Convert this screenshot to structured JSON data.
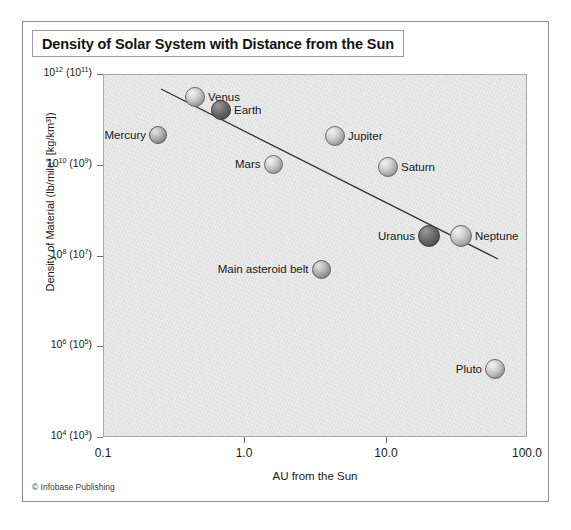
{
  "figure": {
    "title": "Density of Solar System with Distance from the Sun",
    "credit": "© Infobase Publishing"
  },
  "chart_data": {
    "type": "scatter",
    "title": "Density of Solar System with Distance from the Sun",
    "xlabel": "AU from the Sun",
    "ylabel": "Density of Material (lb/mile³ [kg/km³])",
    "xscale": "log",
    "yscale": "log",
    "xlim": [
      0.1,
      100.0
    ],
    "ylim": [
      10000.0,
      1000000000000.0
    ],
    "grid": false,
    "legend": "none",
    "xticks": [
      {
        "value": 0.1,
        "label": "0.1"
      },
      {
        "value": 1.0,
        "label": "1.0"
      },
      {
        "value": 10.0,
        "label": "10.0"
      },
      {
        "value": 100.0,
        "label": "100.0"
      }
    ],
    "yticks": [
      {
        "value": 1000000000000.0,
        "label": "10",
        "exp": "12",
        "alt_label": "(10",
        "alt_exp": "11",
        "alt_close": ")"
      },
      {
        "value": 10000000000.0,
        "label": "10",
        "exp": "10",
        "alt_label": "(10",
        "alt_exp": "9",
        "alt_close": ")"
      },
      {
        "value": 100000000.0,
        "label": "10",
        "exp": "8",
        "alt_label": "(10",
        "alt_exp": "7",
        "alt_close": ")"
      },
      {
        "value": 1000000.0,
        "label": "10",
        "exp": "6",
        "alt_label": "(10",
        "alt_exp": "5",
        "alt_close": ")"
      },
      {
        "value": 10000.0,
        "label": "10",
        "exp": "4",
        "alt_label": "(10",
        "alt_exp": "3",
        "alt_close": ")"
      }
    ],
    "points": [
      {
        "name": "Mercury",
        "x": 0.24,
        "y": 40000000000.0,
        "px": 157,
        "py": 134,
        "r": 9,
        "shade": "mid",
        "label_side": "left"
      },
      {
        "name": "Venus",
        "x": 0.5,
        "y": 300000000000.0,
        "px": 194,
        "py": 96,
        "r": 10,
        "shade": "light",
        "label_side": "right"
      },
      {
        "name": "Earth",
        "x": 0.8,
        "y": 150000000000.0,
        "px": 220,
        "py": 109,
        "r": 10,
        "shade": "dark",
        "label_side": "right"
      },
      {
        "name": "Mars",
        "x": 1.8,
        "y": 10000000000.0,
        "px": 272,
        "py": 163,
        "r": 9.5,
        "shade": "light",
        "label_side": "left"
      },
      {
        "name": "Main asteroid belt",
        "x": 4.0,
        "y": 50000000.0,
        "px": 320,
        "py": 268,
        "r": 9.5,
        "shade": "mid",
        "label_side": "left"
      },
      {
        "name": "Jupiter",
        "x": 5.2,
        "y": 45000000000.0,
        "px": 334,
        "py": 135,
        "r": 10,
        "shade": "light",
        "label_side": "right"
      },
      {
        "name": "Saturn",
        "x": 11.0,
        "y": 9000000000.0,
        "px": 387,
        "py": 166,
        "r": 10,
        "shade": "light",
        "label_side": "right"
      },
      {
        "name": "Uranus",
        "x": 22.0,
        "y": 25000000.0,
        "px": 428,
        "py": 235,
        "r": 11,
        "shade": "dark",
        "label_side": "left"
      },
      {
        "name": "Neptune",
        "x": 35.0,
        "y": 25000000.0,
        "px": 460,
        "py": 235,
        "r": 11,
        "shade": "light",
        "label_side": "right"
      },
      {
        "name": "Pluto",
        "x": 55.0,
        "y": 300000.0,
        "px": 494,
        "py": 368,
        "r": 10,
        "shade": "light",
        "label_side": "left"
      }
    ],
    "trend_line": {
      "label": "fit line",
      "x1_px": 160,
      "y1_px": 88,
      "x2_px": 497,
      "y2_px": 258,
      "color": "#333333"
    }
  }
}
